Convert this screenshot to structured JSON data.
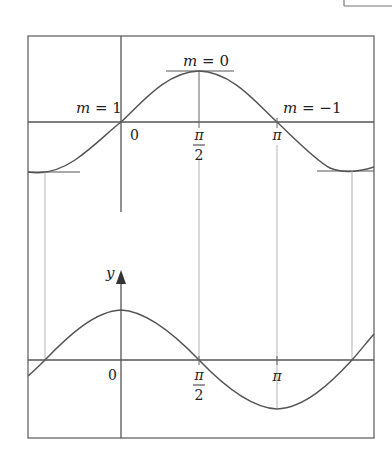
{
  "diagram": {
    "top_graph": {
      "description": "sin(x) curve with tangent slopes marked",
      "labels": {
        "m_zero": "m = 0",
        "m_one": "m = 1",
        "m_neg_one": "m = −1",
        "origin": "0",
        "pi_num": "π",
        "pi_den": "2",
        "pi": "π"
      }
    },
    "bottom_graph": {
      "description": "cos(x) derivative curve",
      "labels": {
        "y_axis": "y",
        "origin": "0",
        "pi_num": "π",
        "pi_den": "2",
        "pi": "π"
      }
    },
    "colors": {
      "stroke": "#555555",
      "frame": "#666666",
      "guide": "#aaaaaa",
      "text": "#222222"
    }
  }
}
